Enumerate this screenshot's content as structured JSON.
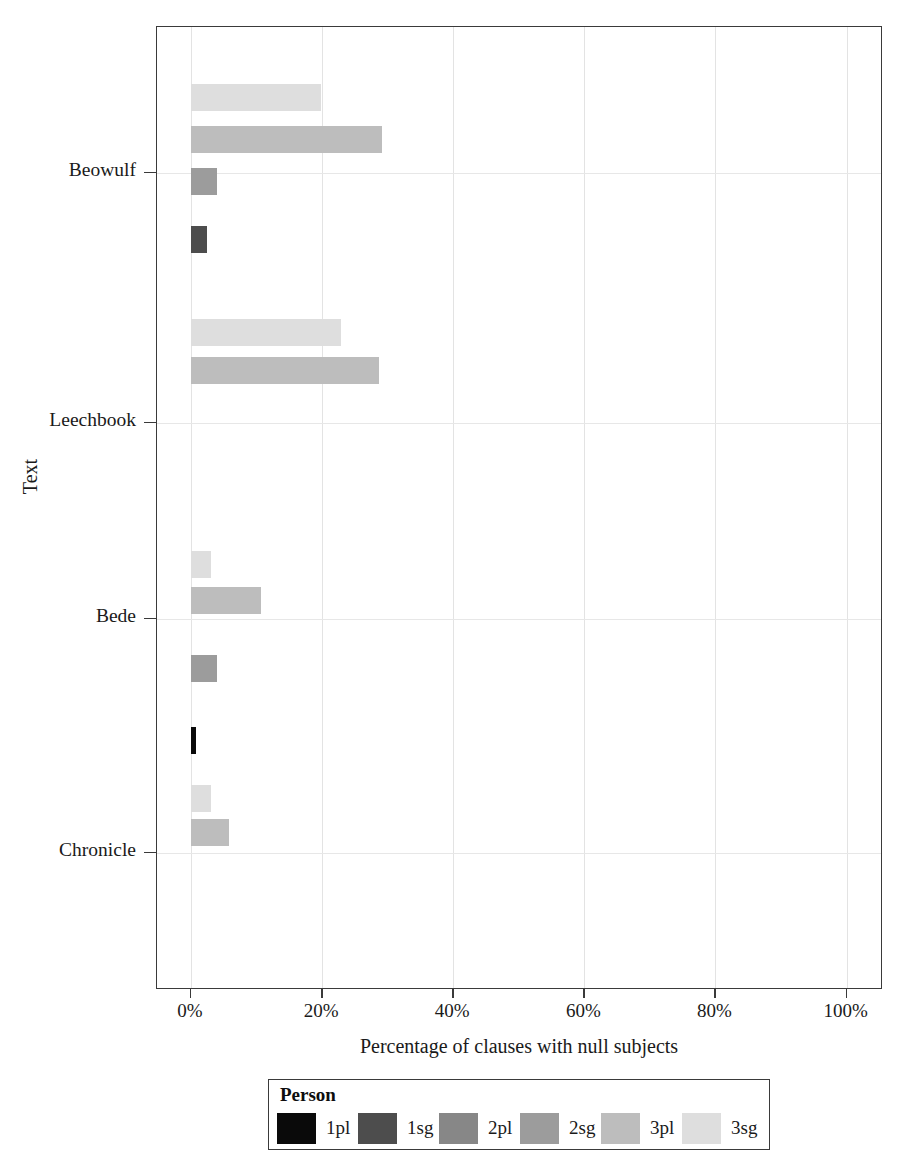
{
  "chart_data": {
    "type": "bar",
    "orientation": "horizontal",
    "title": "",
    "xlabel": "Percentage of clauses with null subjects",
    "ylabel": "Text",
    "xlim": [
      0,
      100
    ],
    "xticks": [
      0,
      20,
      40,
      60,
      80,
      100
    ],
    "xtick_labels": [
      "0%",
      "20%",
      "40%",
      "60%",
      "80%",
      "100%"
    ],
    "categories": [
      "Beowulf",
      "Leechbook",
      "Bede",
      "Chronicle"
    ],
    "grid": "vertical and horizontal, light gray",
    "legend": {
      "title": "Person",
      "position": "below plot, horizontal",
      "entries": [
        "1pl",
        "1sg",
        "2pl",
        "2sg",
        "3pl",
        "3sg"
      ]
    },
    "series": [
      {
        "name": "1pl",
        "color": "#0a0a0a",
        "values": [
          0.0,
          0.0,
          0.0,
          0.8
        ]
      },
      {
        "name": "1sg",
        "color": "#4d4d4d",
        "values": [
          2.5,
          0.0,
          0.0,
          0.0
        ]
      },
      {
        "name": "2pl",
        "color": "#878787",
        "values": [
          0.0,
          0.0,
          0.0,
          0.0
        ]
      },
      {
        "name": "2sg",
        "color": "#9c9c9c",
        "values": [
          4.0,
          0.0,
          4.0,
          0.0
        ]
      },
      {
        "name": "3pl",
        "color": "#bdbdbd",
        "values": [
          29.2,
          28.7,
          10.7,
          5.8
        ]
      },
      {
        "name": "3sg",
        "color": "#dedede",
        "values": [
          19.8,
          22.9,
          3.0,
          3.0
        ]
      }
    ],
    "bars": [
      {
        "category": "Beowulf",
        "person": "3sg",
        "value": 19.8,
        "color": "#dedede",
        "top": 57,
        "left": 0.0,
        "width": 19.8
      },
      {
        "category": "Beowulf",
        "person": "3pl",
        "value": 29.2,
        "color": "#bdbdbd",
        "top": 99,
        "left": 0.0,
        "width": 29.2
      },
      {
        "category": "Beowulf",
        "person": "2sg",
        "value": 4.0,
        "color": "#9c9c9c",
        "top": 141,
        "left": 0.0,
        "width": 4.0
      },
      {
        "category": "Beowulf",
        "person": "1sg",
        "value": 2.5,
        "color": "#4d4d4d",
        "top": 199,
        "left": 0.0,
        "width": 2.5
      },
      {
        "category": "Leechbook",
        "person": "3sg",
        "value": 22.9,
        "color": "#dedede",
        "top": 292,
        "left": 0.0,
        "width": 22.9
      },
      {
        "category": "Leechbook",
        "person": "3pl",
        "value": 28.7,
        "color": "#bdbdbd",
        "top": 330,
        "left": 0.0,
        "width": 28.7
      },
      {
        "category": "Bede",
        "person": "3sg",
        "value": 3.0,
        "color": "#dedede",
        "top": 524,
        "left": 0.0,
        "width": 3.0
      },
      {
        "category": "Bede",
        "person": "3pl",
        "value": 10.7,
        "color": "#bdbdbd",
        "top": 560,
        "left": 0.0,
        "width": 10.7
      },
      {
        "category": "Bede",
        "person": "2sg",
        "value": 4.0,
        "color": "#9c9c9c",
        "top": 628,
        "left": 0.0,
        "width": 4.0
      },
      {
        "category": "Chronicle",
        "person": "1pl",
        "value": 0.8,
        "color": "#0a0a0a",
        "top": 700,
        "left": 0.0,
        "width": 0.8
      },
      {
        "category": "Chronicle",
        "person": "3sg",
        "value": 3.0,
        "color": "#dedede",
        "top": 758,
        "left": 0.0,
        "width": 3.0
      },
      {
        "category": "Chronicle",
        "person": "3pl",
        "value": 5.8,
        "color": "#bdbdbd",
        "top": 792,
        "left": 0.0,
        "width": 5.8
      }
    ],
    "category_tick_y": [
      146,
      396,
      592,
      826
    ],
    "gridlines_y": [
      146,
      396,
      592,
      826
    ]
  },
  "axis": {
    "xlabel": "Percentage of clauses with null subjects",
    "ylabel": "Text",
    "xticks": [
      "0%",
      "20%",
      "40%",
      "60%",
      "80%",
      "100%"
    ],
    "yticks": [
      "Beowulf",
      "Leechbook",
      "Bede",
      "Chronicle"
    ]
  },
  "legend": {
    "title": "Person",
    "items": [
      {
        "label": "1pl",
        "color": "#0a0a0a"
      },
      {
        "label": "1sg",
        "color": "#4d4d4d"
      },
      {
        "label": "2pl",
        "color": "#878787"
      },
      {
        "label": "2sg",
        "color": "#9c9c9c"
      },
      {
        "label": "3pl",
        "color": "#bdbdbd"
      },
      {
        "label": "3sg",
        "color": "#dedede"
      }
    ]
  }
}
